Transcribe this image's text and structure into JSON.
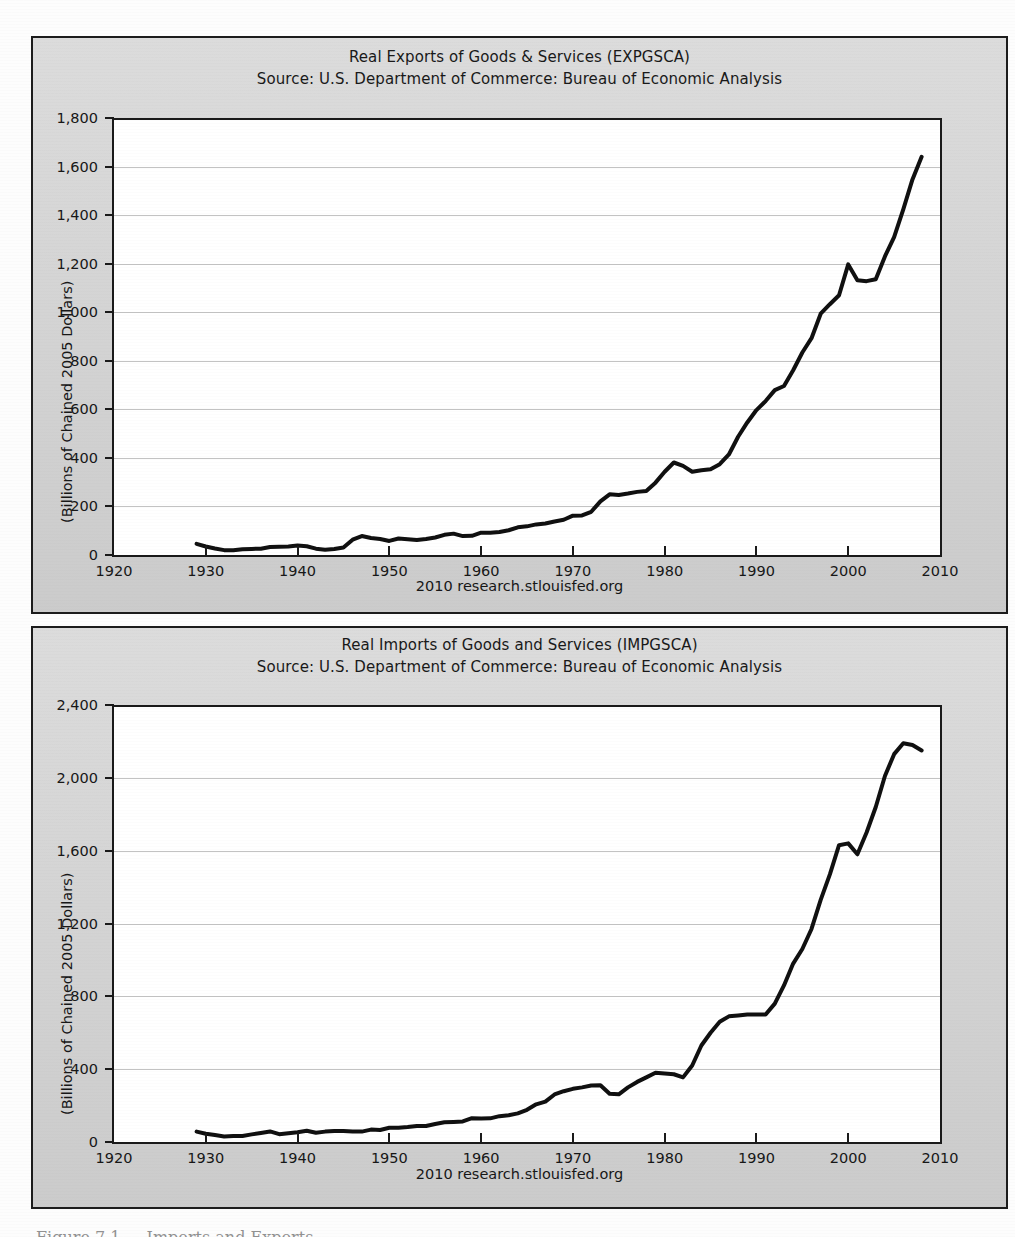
{
  "document": {
    "background_color": "#fdfdfd",
    "panel_background": "#d2d2d2",
    "plot_background": "#ffffff",
    "line_color": "#101010",
    "grid_color": "#b9b9b9",
    "bottom_caption_fragment": "Figure 7.1 — Imports and Exports"
  },
  "charts": [
    {
      "id": "exports",
      "title": "Real Exports of Goods & Services (EXPGSCA)",
      "subtitle": "Source: U.S. Department of Commerce: Bureau of Economic Analysis",
      "ylabel": "(Billions of Chained 2005 Dollars)",
      "footer": "2010 research.stlouisfed.org",
      "yticks": [
        "1,800",
        "1,600",
        "1,400",
        "1,200",
        "1,000",
        "800",
        "600",
        "400",
        "200",
        "0"
      ],
      "xticks": [
        "1920",
        "1930",
        "1940",
        "1950",
        "1960",
        "1970",
        "1980",
        "1990",
        "2000",
        "2010"
      ]
    },
    {
      "id": "imports",
      "title": "Real Imports of Goods and Services (IMPGSCA)",
      "subtitle": "Source: U.S. Department of Commerce: Bureau of Economic Analysis",
      "ylabel": "(Billions of Chained 2005 Dollars)",
      "footer": "2010 research.stlouisfed.org",
      "yticks": [
        "2,400",
        "2,000",
        "1,600",
        "1,200",
        "800",
        "400",
        "0"
      ],
      "xticks": [
        "1920",
        "1930",
        "1940",
        "1950",
        "1960",
        "1970",
        "1980",
        "1990",
        "2000",
        "2010"
      ]
    }
  ],
  "chart_data": [
    {
      "type": "line",
      "title": "Real Exports of Goods & Services (EXPGSCA)",
      "subtitle": "Source: U.S. Department of Commerce: Bureau of Economic Analysis",
      "xlabel": "",
      "ylabel": "(Billions of Chained 2005 Dollars)",
      "xlim": [
        1920,
        2010
      ],
      "ylim": [
        0,
        1800
      ],
      "ytick_values": [
        0,
        200,
        400,
        600,
        800,
        1000,
        1200,
        1400,
        1600,
        1800
      ],
      "xtick_values": [
        1920,
        1930,
        1940,
        1950,
        1960,
        1970,
        1980,
        1990,
        2000,
        2010
      ],
      "grid": true,
      "legend": "none",
      "annotation": "2010 research.stlouisfed.org",
      "series": [
        {
          "name": "EXPGSCA",
          "x": [
            1929,
            1930,
            1931,
            1932,
            1933,
            1934,
            1935,
            1936,
            1937,
            1938,
            1939,
            1940,
            1941,
            1942,
            1943,
            1944,
            1945,
            1946,
            1947,
            1948,
            1949,
            1950,
            1951,
            1952,
            1953,
            1954,
            1955,
            1956,
            1957,
            1958,
            1959,
            1960,
            1961,
            1962,
            1963,
            1964,
            1965,
            1966,
            1967,
            1968,
            1969,
            1970,
            1971,
            1972,
            1973,
            1974,
            1975,
            1976,
            1977,
            1978,
            1979,
            1980,
            1981,
            1982,
            1983,
            1984,
            1985,
            1986,
            1987,
            1988,
            1989,
            1990,
            1991,
            1992,
            1993,
            1994,
            1995,
            1996,
            1997,
            1998,
            1999,
            2000,
            2001,
            2002,
            2003,
            2004,
            2005,
            2006,
            2007,
            2008
          ],
          "values": [
            46,
            35,
            27,
            20,
            20,
            24,
            25,
            26,
            33,
            34,
            35,
            39,
            36,
            26,
            22,
            25,
            31,
            63,
            78,
            70,
            66,
            58,
            68,
            65,
            62,
            66,
            72,
            83,
            88,
            78,
            79,
            92,
            92,
            95,
            102,
            114,
            118,
            126,
            130,
            138,
            145,
            162,
            163,
            178,
            221,
            250,
            247,
            253,
            260,
            264,
            298,
            343,
            381,
            367,
            343,
            349,
            353,
            374,
            414,
            487,
            546,
            597,
            634,
            679,
            696,
            761,
            834,
            893,
            994,
            1033,
            1070,
            1197,
            1132,
            1128,
            1136,
            1230,
            1309,
            1424,
            1547,
            1640
          ]
        }
      ]
    },
    {
      "type": "line",
      "title": "Real Imports of Goods and Services (IMPGSCA)",
      "subtitle": "Source: U.S. Department of Commerce: Bureau of Economic Analysis",
      "xlabel": "",
      "ylabel": "(Billions of Chained 2005 Dollars)",
      "xlim": [
        1920,
        2010
      ],
      "ylim": [
        0,
        2400
      ],
      "ytick_values": [
        0,
        400,
        800,
        1200,
        1600,
        2000,
        2400
      ],
      "xtick_values": [
        1920,
        1930,
        1940,
        1950,
        1960,
        1970,
        1980,
        1990,
        2000,
        2010
      ],
      "grid": true,
      "legend": "none",
      "annotation": "2010 research.stlouisfed.org",
      "series": [
        {
          "name": "IMPGSCA",
          "x": [
            1929,
            1930,
            1931,
            1932,
            1933,
            1934,
            1935,
            1936,
            1937,
            1938,
            1939,
            1940,
            1941,
            1942,
            1943,
            1944,
            1945,
            1946,
            1947,
            1948,
            1949,
            1950,
            1951,
            1952,
            1953,
            1954,
            1955,
            1956,
            1957,
            1958,
            1959,
            1960,
            1961,
            1962,
            1963,
            1964,
            1965,
            1966,
            1967,
            1968,
            1969,
            1970,
            1971,
            1972,
            1973,
            1974,
            1975,
            1976,
            1977,
            1978,
            1979,
            1980,
            1981,
            1982,
            1983,
            1984,
            1985,
            1986,
            1987,
            1988,
            1989,
            1990,
            1991,
            1992,
            1993,
            1994,
            1995,
            1996,
            1997,
            1998,
            1999,
            2000,
            2001,
            2002,
            2003,
            2004,
            2005,
            2006,
            2007,
            2008
          ],
          "values": [
            57,
            45,
            38,
            30,
            33,
            33,
            42,
            50,
            58,
            43,
            48,
            54,
            62,
            51,
            57,
            60,
            61,
            58,
            57,
            68,
            66,
            78,
            78,
            82,
            88,
            88,
            99,
            108,
            110,
            113,
            131,
            129,
            130,
            142,
            147,
            157,
            177,
            207,
            222,
            261,
            279,
            292,
            313,
            366,
            386,
            371,
            336,
            404,
            445,
            487,
            501,
            476,
            490,
            477,
            553,
            693,
            743,
            824,
            895,
            952,
            1007,
            1042,
            1029,
            1104,
            1192,
            1320,
            1417,
            1545,
            1728,
            1897,
            2078,
            2301,
            2249,
            2326,
            2410,
            2648,
            2791,
            2901,
            2937,
            2896
          ],
          "values_as_plotted": [
            57,
            45,
            38,
            30,
            33,
            33,
            42,
            50,
            58,
            43,
            48,
            54,
            62,
            51,
            57,
            60,
            61,
            58,
            57,
            68,
            66,
            78,
            78,
            82,
            88,
            88,
            99,
            108,
            110,
            113,
            131,
            129,
            130,
            142,
            147,
            157,
            177,
            207,
            222,
            261,
            279,
            292,
            300,
            310,
            312,
            265,
            262,
            300,
            330,
            355,
            380,
            376,
            372,
            355,
            420,
            530,
            600,
            660,
            690,
            695,
            700,
            700,
            700,
            760,
            860,
            980,
            1060,
            1170,
            1330,
            1470,
            1630,
            1640,
            1580,
            1700,
            1840,
            2010,
            2130,
            2190,
            2180,
            2150
          ]
        }
      ]
    }
  ]
}
